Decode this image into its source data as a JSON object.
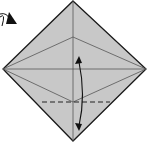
{
  "diagram": {
    "type": "origami-fold-step",
    "colors": {
      "paper": "#c8c8c8",
      "outline": "#1a1a1a",
      "crease": "#555555",
      "arrow": "#111111",
      "background": "#ffffff"
    },
    "elements": [
      {
        "id": "paper-diamond",
        "kind": "square rotated 45°"
      },
      {
        "id": "center-kite-creases",
        "kind": "crease lines"
      },
      {
        "id": "horizontal-crease",
        "kind": "crease line"
      },
      {
        "id": "vertical-crease",
        "kind": "crease line"
      },
      {
        "id": "valley-fold-line",
        "kind": "dashed line"
      },
      {
        "id": "fold-arrow",
        "kind": "double-headed curved arrow"
      },
      {
        "id": "turn-over-arrow",
        "kind": "curved arrow, top-left"
      }
    ]
  }
}
